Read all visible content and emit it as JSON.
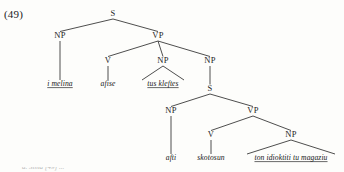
{
  "figure": {
    "example_number": "(49)",
    "caption_bleed": "a. Sima [49] ..."
  },
  "tree": {
    "nodes": [
      {
        "id": "S1",
        "label": "S",
        "x": 113,
        "y": 16
      },
      {
        "id": "NP1",
        "label": "NP",
        "x": 60,
        "y": 38
      },
      {
        "id": "VP1",
        "label": "VP",
        "x": 158,
        "y": 38
      },
      {
        "id": "V1",
        "label": "V",
        "x": 108,
        "y": 63
      },
      {
        "id": "NP2",
        "label": "NP",
        "x": 163,
        "y": 63
      },
      {
        "id": "NP3",
        "label": "NP",
        "x": 210,
        "y": 63
      },
      {
        "id": "S2",
        "label": "S",
        "x": 210,
        "y": 91
      },
      {
        "id": "NP4",
        "label": "NP",
        "x": 171,
        "y": 113
      },
      {
        "id": "VP2",
        "label": "VP",
        "x": 253,
        "y": 113
      },
      {
        "id": "V2",
        "label": "V",
        "x": 211,
        "y": 137
      },
      {
        "id": "NP5",
        "label": "NP",
        "x": 291,
        "y": 137
      }
    ],
    "leaves": [
      {
        "id": "L1",
        "text": "i melina",
        "x": 60,
        "y": 86,
        "parent": "NP1",
        "triangle": false,
        "underline": true
      },
      {
        "id": "L2",
        "text": "afise",
        "x": 108,
        "y": 86,
        "parent": "V1",
        "triangle": false,
        "underline": false
      },
      {
        "id": "L3",
        "text": "tus kleftes",
        "x": 163,
        "y": 86,
        "parent": "NP2",
        "triangle": true,
        "underline": true
      },
      {
        "id": "L4",
        "text": "afti",
        "x": 171,
        "y": 160,
        "parent": "NP4",
        "triangle": false,
        "underline": false
      },
      {
        "id": "L5",
        "text": "skotosun",
        "x": 211,
        "y": 160,
        "parent": "V2",
        "triangle": false,
        "underline": false
      },
      {
        "id": "L6",
        "text": "ton idioktiti tu magaziu",
        "x": 291,
        "y": 160,
        "parent": "NP5",
        "triangle": true,
        "underline": true
      }
    ],
    "edges": [
      {
        "from": "S1",
        "to": "NP1"
      },
      {
        "from": "S1",
        "to": "VP1"
      },
      {
        "from": "VP1",
        "to": "V1"
      },
      {
        "from": "VP1",
        "to": "NP2"
      },
      {
        "from": "VP1",
        "to": "NP3"
      },
      {
        "from": "NP3",
        "to": "S2"
      },
      {
        "from": "S2",
        "to": "NP4"
      },
      {
        "from": "S2",
        "to": "VP2"
      },
      {
        "from": "VP2",
        "to": "V2"
      },
      {
        "from": "VP2",
        "to": "NP5"
      },
      {
        "from": "NP1",
        "to": "L1"
      },
      {
        "from": "V1",
        "to": "L2"
      },
      {
        "from": "NP4",
        "to": "L4"
      },
      {
        "from": "V2",
        "to": "L5"
      }
    ],
    "triangles": [
      {
        "apex": "NP2",
        "leaf": "L3",
        "half_width": 21
      },
      {
        "apex": "NP5",
        "leaf": "L6",
        "half_width": 44
      }
    ]
  },
  "colors": {
    "background": "#fdfdfb",
    "ink": "#1f1f1f",
    "line": "#3a3a3a"
  }
}
